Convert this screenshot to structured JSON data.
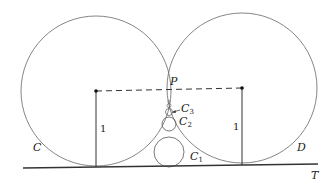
{
  "diagram": {
    "labels": {
      "point_p": "P",
      "circle_c": "C",
      "circle_d": "D",
      "tangent_line": "T",
      "radius_left": "1",
      "radius_right": "1",
      "c1_main": "C",
      "c1_sub": "1",
      "c2_main": "C",
      "c2_sub": "2",
      "c3_main": "C",
      "c3_sub": "3"
    },
    "colors": {
      "stroke": "#555555",
      "line": "#333333"
    }
  }
}
